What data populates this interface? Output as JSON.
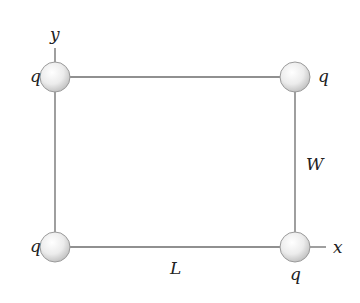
{
  "diagram": {
    "type": "rectangle-point-charges",
    "colors": {
      "line": "#6b6b6b",
      "sphere_edge": "#9a9a9a",
      "sphere_light": "#ffffff",
      "sphere_dark": "#c8c8c8",
      "text": "#222222"
    },
    "axes": {
      "y_label": "y",
      "x_label": "x"
    },
    "dimensions": {
      "length_label": "L",
      "width_label": "W"
    },
    "charges": [
      {
        "position": "top-left",
        "label": "q"
      },
      {
        "position": "top-right",
        "label": "q"
      },
      {
        "position": "bottom-left",
        "label": "q"
      },
      {
        "position": "bottom-right",
        "label": "q"
      }
    ]
  }
}
